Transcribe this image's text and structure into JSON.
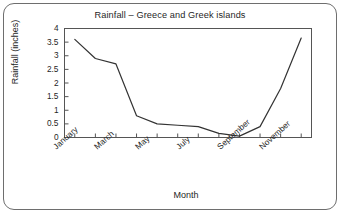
{
  "chart_data": {
    "type": "line",
    "title": "Rainfall – Greece and Greek islands",
    "xlabel": "Month",
    "ylabel": "Rainfall (inches)",
    "categories": [
      "January",
      "February",
      "March",
      "April",
      "May",
      "June",
      "July",
      "August",
      "September",
      "October",
      "November",
      "December"
    ],
    "x_tick_labels": [
      "January",
      "March",
      "May",
      "July",
      "September",
      "November"
    ],
    "x_tick_label_step": 2,
    "values": [
      3.6,
      2.9,
      2.7,
      0.8,
      0.5,
      0.45,
      0.4,
      0.15,
      0.05,
      0.4,
      1.8,
      3.65
    ],
    "series": [
      {
        "name": "Rainfall",
        "values": [
          3.6,
          2.9,
          2.7,
          0.8,
          0.5,
          0.45,
          0.4,
          0.15,
          0.05,
          0.4,
          1.8,
          3.65
        ]
      }
    ],
    "ylim": [
      0,
      4
    ],
    "y_tick_labels": [
      "4",
      "3.5",
      "3",
      "2.5",
      "2",
      "1.5",
      "1",
      "0.5",
      "0"
    ],
    "y_tick_values": [
      4,
      3.5,
      3,
      2.5,
      2,
      1.5,
      1,
      0.5,
      0
    ],
    "grid": false,
    "legend": false,
    "line_color": "#333333",
    "axis_color": "#555555",
    "frame_color": "#6e6e6e",
    "background_color": "#ffffff"
  }
}
